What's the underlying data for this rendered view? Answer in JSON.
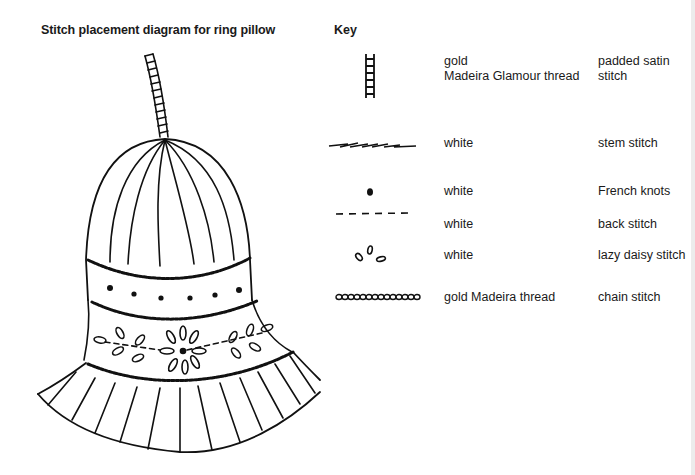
{
  "diagram": {
    "title": "Stitch placement diagram for ring pillow"
  },
  "key": {
    "title": "Key",
    "rows": [
      {
        "symbol": "ladder-symbol",
        "thread": "gold\nMadeira Glamour thread",
        "thread_line1": "gold",
        "thread_line2": "Madeira Glamour thread",
        "stitch_line1": "padded satin",
        "stitch_line2": "stitch"
      },
      {
        "symbol": "stem-stitch-line",
        "thread": "white",
        "stitch": "stem stitch"
      },
      {
        "symbol": "dot",
        "thread": "white",
        "stitch": "French knots"
      },
      {
        "symbol": "dashed-line",
        "thread": "white",
        "stitch": "back stitch"
      },
      {
        "symbol": "loops",
        "thread": "white",
        "stitch": "lazy daisy stitch"
      },
      {
        "symbol": "chain-line",
        "thread": "gold Madeira thread",
        "stitch": "chain stitch"
      }
    ]
  }
}
